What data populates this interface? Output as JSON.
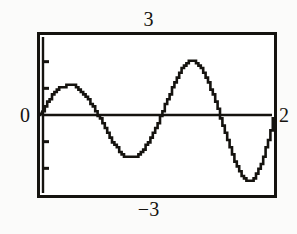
{
  "screen": {
    "background_color": "#fbfbfa",
    "ink_color": "#15130f",
    "plot_background_color": "#ffffff"
  },
  "labels": {
    "ymax": "3",
    "ymin": "−3",
    "xmin": "0",
    "xmax": "2"
  },
  "chart_data": {
    "type": "line",
    "title": "",
    "xlabel": "",
    "ylabel": "",
    "xlim": [
      0,
      2
    ],
    "ylim": [
      -3,
      3
    ],
    "grid": false,
    "legend": null,
    "axis_style": "boxed-viewport-with-y-axis-ticks",
    "x_tick_labels": [
      "0",
      "2"
    ],
    "y_tick_labels": [
      "3",
      "-3"
    ],
    "y_tick_values": [
      -2,
      -1,
      1,
      2
    ],
    "zero_line": 0,
    "features": {
      "zero_crossings": [
        0.0,
        0.49,
        1.025,
        1.53,
        2.0
      ],
      "peaks": [
        {
          "x": 0.285,
          "y": 1.1
        },
        {
          "x": 1.235,
          "y": 2.02
        }
      ],
      "troughs": [
        {
          "x": 0.755,
          "y": -1.58
        },
        {
          "x": 1.68,
          "y": -2.47
        }
      ]
    },
    "series": [
      {
        "name": "curve",
        "color": "#15130f",
        "x": [
          0.0,
          0.04,
          0.08,
          0.12,
          0.16,
          0.2,
          0.24,
          0.28,
          0.32,
          0.36,
          0.4,
          0.44,
          0.48,
          0.52,
          0.56,
          0.6,
          0.64,
          0.68,
          0.72,
          0.76,
          0.8,
          0.84,
          0.88,
          0.92,
          0.96,
          1.0,
          1.04,
          1.08,
          1.12,
          1.16,
          1.2,
          1.24,
          1.28,
          1.32,
          1.36,
          1.4,
          1.44,
          1.48,
          1.52,
          1.56,
          1.6,
          1.64,
          1.68,
          1.72,
          1.76,
          1.8,
          1.84,
          1.88,
          1.92,
          1.96,
          2.0
        ],
        "y": [
          0.0,
          0.31,
          0.6,
          0.83,
          0.99,
          1.08,
          1.1,
          1.1,
          1.01,
          0.85,
          0.64,
          0.38,
          0.09,
          -0.23,
          -0.55,
          -0.87,
          -1.15,
          -1.38,
          -1.53,
          -1.58,
          -1.57,
          -1.47,
          -1.28,
          -1.02,
          -0.69,
          -0.32,
          0.09,
          0.52,
          0.94,
          1.33,
          1.67,
          1.93,
          2.02,
          2.0,
          1.84,
          1.56,
          1.17,
          0.7,
          0.17,
          -0.39,
          -0.95,
          -1.47,
          -1.92,
          -2.28,
          -2.45,
          -2.44,
          -2.25,
          -1.88,
          -1.36,
          -0.72,
          -0.01
        ]
      }
    ]
  }
}
